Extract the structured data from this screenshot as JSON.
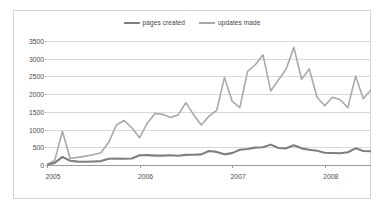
{
  "chart_data": {
    "type": "line",
    "title": "",
    "xlabel": "",
    "ylabel": "",
    "ylim": [
      0,
      3500
    ],
    "ytick_step": 500,
    "yticks": [
      "0",
      "500",
      "1000",
      "1500",
      "2000",
      "2500",
      "3000",
      "3500"
    ],
    "xticks": [
      "2005",
      "2006",
      "2007",
      "2008"
    ],
    "xtick_positions": [
      0,
      12,
      24,
      36
    ],
    "grid": "horizontal",
    "legend_position": "top-center",
    "x_count": 43,
    "x": [
      "2005-01",
      "2005-02",
      "2005-03",
      "2005-04",
      "2005-05",
      "2005-06",
      "2005-07",
      "2005-08",
      "2005-09",
      "2005-10",
      "2005-11",
      "2005-12",
      "2006-01",
      "2006-02",
      "2006-03",
      "2006-04",
      "2006-05",
      "2006-06",
      "2006-07",
      "2006-08",
      "2006-09",
      "2006-10",
      "2006-11",
      "2006-12",
      "2007-01",
      "2007-02",
      "2007-03",
      "2007-04",
      "2007-05",
      "2007-06",
      "2007-07",
      "2007-08",
      "2007-09",
      "2007-10",
      "2007-11",
      "2007-12",
      "2008-01",
      "2008-02",
      "2008-03",
      "2008-04",
      "2008-05",
      "2008-06",
      "2008-07"
    ],
    "series": [
      {
        "name": "pages created",
        "color": "#7f7f7f",
        "values": [
          10,
          60,
          230,
          120,
          95,
          90,
          100,
          110,
          175,
          185,
          175,
          185,
          275,
          280,
          265,
          265,
          275,
          260,
          285,
          290,
          300,
          395,
          370,
          300,
          335,
          430,
          450,
          490,
          500,
          575,
          480,
          470,
          555,
          470,
          430,
          400,
          345,
          340,
          330,
          360,
          470,
          395,
          390
        ]
      },
      {
        "name": "updates made",
        "color": "#a9a9a9",
        "values": [
          10,
          130,
          950,
          185,
          215,
          250,
          290,
          345,
          640,
          1130,
          1255,
          1050,
          770,
          1180,
          1455,
          1430,
          1340,
          1415,
          1760,
          1420,
          1130,
          1380,
          1540,
          2470,
          1800,
          1620,
          2640,
          2830,
          3110,
          2090,
          2400,
          2710,
          3320,
          2420,
          2710,
          1910,
          1670,
          1910,
          1840,
          1620,
          2510,
          1870,
          2120
        ]
      }
    ]
  },
  "legend": {
    "entries": [
      {
        "label": "pages created"
      },
      {
        "label": "updates made"
      }
    ]
  }
}
